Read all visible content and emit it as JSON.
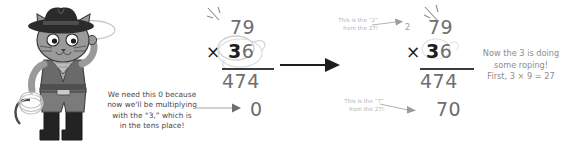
{
  "scene": {
    "title": "Long multiplication step - 79 times 36",
    "background_color": "#ffffff"
  },
  "mascot": {
    "name": "cowboy-cat",
    "description": "Grey cartoon cat wearing a cowboy hat, vest, bandana and boots, holding a lasso",
    "colors": {
      "fur": "#9a9a9a",
      "hat": "#2b2b2b",
      "vest": "#5d5d5d",
      "boots": "#232323",
      "rope": "#d8d8d8",
      "outline": "#3a3a3a"
    }
  },
  "captions": {
    "left": {
      "lines": [
        "We need this 0 because",
        "now we'll be multiplying",
        "with the “3,” which is",
        "in the tens place!"
      ],
      "color": "#4a4a4a"
    },
    "right": {
      "lines": [
        "Now the 3 is doing",
        "some roping!",
        "First, 3 × 9 = 27"
      ],
      "color": "#8d8d8d"
    }
  },
  "annotations": {
    "carry_two": {
      "lines": [
        "This is the “2”",
        "from the 27!"
      ],
      "color": "#b4b4b4"
    },
    "digit_seven": {
      "lines": [
        "This is the “7”",
        "from the 27!"
      ],
      "color": "#b4b4b4"
    }
  },
  "problems": [
    {
      "id": "problem-before",
      "multiplicand": "79",
      "operator": "×",
      "multiplier": "36",
      "partial_product_first": "474",
      "partial_product_second": "0",
      "carry": "",
      "lassoed_digit": "3",
      "note": "Placeholder zero written in the ones column"
    },
    {
      "id": "problem-after",
      "multiplicand": "79",
      "operator": "×",
      "multiplier": "36",
      "partial_product_first": "474",
      "partial_product_second": "70",
      "carry": "2",
      "lassoed_digit": "3",
      "note": "3 x 9 = 27, write 7 carry 2"
    }
  ],
  "arrow": {
    "name": "progression-arrow",
    "direction": "right",
    "color": "#1d1d1d"
  },
  "colors": {
    "digit_gray": "#6e6e6e",
    "digit_dark": "#1d1d1d",
    "carry_gray": "#9a9a9a",
    "rope_gray": "#cfcfcf",
    "annotation_gray": "#b4b4b4",
    "arrow_gray": "#a8a8a8"
  }
}
